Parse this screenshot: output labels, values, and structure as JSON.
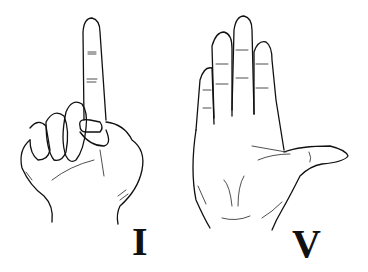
{
  "illustration": {
    "description": "Line drawing of two hands showing Roman numerals",
    "panels": [
      {
        "gesture": "one index finger raised",
        "label": "I"
      },
      {
        "gesture": "open hand, four fingers raised with thumb extended",
        "label": "V"
      }
    ]
  },
  "colors": {
    "background": "#ffffff",
    "ink": "#111111"
  }
}
